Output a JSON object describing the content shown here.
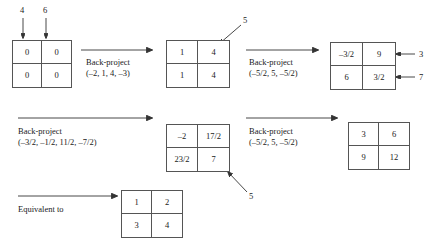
{
  "figure": {
    "type": "diagram"
  },
  "inputs": {
    "col_top_left": "4",
    "col_top_right": "6",
    "row_right_top": "3",
    "row_right_bottom": "7",
    "annot_five_upper": "5",
    "annot_five_lower": "5"
  },
  "grids": [
    {
      "name": "grid-zero",
      "cells": [
        "0",
        "0",
        "0",
        "0"
      ]
    },
    {
      "name": "grid-ones-fours",
      "cells": [
        "1",
        "4",
        "1",
        "4"
      ]
    },
    {
      "name": "grid-halves",
      "cells": [
        "–3/2",
        "9",
        "6",
        "3/2"
      ]
    },
    {
      "name": "grid-mixed",
      "cells": [
        "–2",
        "17/2",
        "23/2",
        "7"
      ]
    },
    {
      "name": "grid-result",
      "cells": [
        "3",
        "6",
        "9",
        "12"
      ]
    },
    {
      "name": "grid-equivalent",
      "cells": [
        "1",
        "2",
        "3",
        "4"
      ]
    }
  ],
  "operations": [
    {
      "name": "back-project-1",
      "title": "Back-project",
      "params": "(–2, 1, 4,  –3)"
    },
    {
      "name": "back-project-2",
      "title": "Back-project",
      "params": "(–5/2, 5, –5/2)"
    },
    {
      "name": "back-project-3",
      "title": "Back-project",
      "params": "(–3/2, –1/2, 11/2, –7/2)"
    },
    {
      "name": "back-project-4",
      "title": "Back-project",
      "params": "(–5/2, 5, –5/2)"
    },
    {
      "name": "equivalent-to",
      "title": "Equivalent to",
      "params": ""
    }
  ],
  "colors": {
    "ink": "#1a1a1a",
    "rule": "#555555",
    "arrow": "#333333",
    "background": "#ffffff"
  }
}
